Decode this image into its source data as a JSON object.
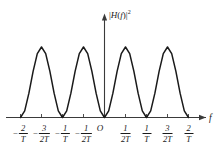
{
  "figure": {
    "background_color": "#ffffff",
    "curve_color": "#1a1a1a",
    "axis_color": "#3a3a3a"
  },
  "axes": {
    "y_label_prefix": "|",
    "y_label_h": "H",
    "y_label_open": "(",
    "y_label_f": "f",
    "y_label_close": ")|",
    "y_label_exponent": "2",
    "x_label": "f",
    "origin_label": "O"
  },
  "ticks": [
    {
      "label_numerator": "2",
      "label_denominator": "T",
      "negative": true,
      "value": -2.0
    },
    {
      "label_numerator": "3",
      "label_denominator": "2T",
      "negative": true,
      "value": -1.5
    },
    {
      "label_numerator": "1",
      "label_denominator": "T",
      "negative": true,
      "value": -1.0
    },
    {
      "label_numerator": "1",
      "label_denominator": "2T",
      "negative": true,
      "value": -0.5
    },
    {
      "label_numerator": "1",
      "label_denominator": "2T",
      "negative": false,
      "value": 0.5
    },
    {
      "label_numerator": "1",
      "label_denominator": "T",
      "negative": false,
      "value": 1.0
    },
    {
      "label_numerator": "3",
      "label_denominator": "2T",
      "negative": false,
      "value": 1.5
    },
    {
      "label_numerator": "2",
      "label_denominator": "T",
      "negative": false,
      "value": 2.0
    }
  ],
  "chart_data": {
    "type": "line",
    "title": "",
    "subtitle": "",
    "xlabel": "f",
    "ylabel": "|H(f)|^2",
    "xlim": [
      -2.25,
      2.35
    ],
    "ylim": [
      0,
      1.12
    ],
    "grid": false,
    "legend": null,
    "x_tick_values": [
      -2.0,
      -1.5,
      -1.0,
      -0.5,
      0.5,
      1.0,
      1.5,
      2.0
    ],
    "x_tick_labels": [
      "-2/T",
      "-3/2T",
      "-1/T",
      "-1/2T",
      "1/2T",
      "1/T",
      "3/2T",
      "2/T"
    ],
    "y_tick_values": [],
    "y_tick_labels": [],
    "zeros": [
      -2.0,
      -1.0,
      0.0,
      1.0,
      2.0
    ],
    "peaks": [
      {
        "x": -1.5,
        "y": 1.0
      },
      {
        "x": -0.5,
        "y": 1.0
      },
      {
        "x": 0.5,
        "y": 1.0
      },
      {
        "x": 1.5,
        "y": 1.0
      }
    ],
    "series": [
      {
        "name": "|H(f)|^2",
        "x": [
          -2.0,
          -1.9,
          -1.8,
          -1.7,
          -1.6,
          -1.5,
          -1.4,
          -1.3,
          -1.2,
          -1.1,
          -1.0,
          -0.9,
          -0.8,
          -0.7,
          -0.6,
          -0.5,
          -0.4,
          -0.3,
          -0.2,
          -0.1,
          0.0,
          0.1,
          0.2,
          0.3,
          0.4,
          0.5,
          0.6,
          0.7,
          0.8,
          0.9,
          1.0,
          1.1,
          1.2,
          1.3,
          1.4,
          1.5,
          1.6,
          1.7,
          1.8,
          1.9,
          2.0
        ],
        "y": [
          0.0,
          0.095,
          0.345,
          0.655,
          0.905,
          1.0,
          0.905,
          0.655,
          0.345,
          0.095,
          0.0,
          0.095,
          0.345,
          0.655,
          0.905,
          1.0,
          0.905,
          0.655,
          0.345,
          0.095,
          0.0,
          0.095,
          0.345,
          0.655,
          0.905,
          1.0,
          0.905,
          0.655,
          0.345,
          0.095,
          0.0,
          0.095,
          0.345,
          0.655,
          0.905,
          1.0,
          0.905,
          0.655,
          0.345,
          0.095,
          0.0
        ]
      }
    ]
  }
}
